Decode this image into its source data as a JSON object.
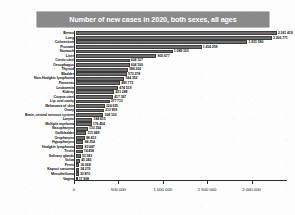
{
  "chart_data": {
    "type": "bar",
    "orientation": "horizontal",
    "title": "Number of new cases in 2020, both sexes, all ages",
    "xlabel": "",
    "ylabel": "",
    "xlim": [
      0,
      2400000
    ],
    "grid": false,
    "legend": null,
    "bar_color": "#6e6e6e",
    "title_bg_color": "#8a8a8a",
    "title_text_color": "#ffffff",
    "axis_ticks": [
      "0",
      "500 000",
      "1 000 000",
      "1 500 000",
      "2 000 000"
    ],
    "axis_tick_values": [
      0,
      500000,
      1000000,
      1500000,
      2000000
    ],
    "categories": [
      "Breast",
      "Lung",
      "Colorectum",
      "Prostate",
      "Stomach",
      "Liver",
      "Cervix uteri",
      "Oesophagus",
      "Thyroid",
      "Bladder",
      "Non-Hodgkin lymphoma",
      "Pancreas",
      "Leukaemia",
      "Kidney",
      "Corpus uteri",
      "Lip, oral cavity",
      "Melanoma of skin",
      "Ovary",
      "Brain, central nervous system",
      "Larynx",
      "Multiple myeloma",
      "Nasopharynx",
      "Gallbladder",
      "Oropharynx",
      "Hypopharynx",
      "Hodgkin lymphoma",
      "Testis",
      "Salivary glands",
      "Vulva",
      "Penis",
      "Kaposi sarcoma",
      "Mesothelioma",
      "Vagina"
    ],
    "values": [
      2261419,
      2206771,
      1931590,
      1414259,
      1089103,
      905677,
      604127,
      604100,
      586202,
      573278,
      544352,
      495773,
      474519,
      431288,
      417367,
      377713,
      324635,
      313959,
      308102,
      184615,
      176404,
      133354,
      115949,
      98412,
      84254,
      83087,
      74458,
      53583,
      45240,
      36068,
      34270,
      30870,
      17908
    ],
    "value_labels": [
      "2 261 419",
      "2 206 771",
      "1 931 590",
      "1 414 259",
      "1 089 103",
      "905 677",
      "604 127",
      "604 100",
      "586 202",
      "573 278",
      "544 352",
      "495 773",
      "474 519",
      "431 288",
      "417 367",
      "377 713",
      "324 635",
      "313 959",
      "308 102",
      "184 615",
      "176 404",
      "133 354",
      "115 949",
      "98 412",
      "84 254",
      "83 087",
      "74 458",
      "53 583",
      "45 240",
      "36 068",
      "34 270",
      "30 870",
      "17 908"
    ]
  }
}
